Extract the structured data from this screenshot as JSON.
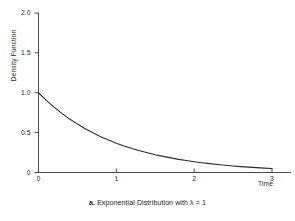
{
  "figure": {
    "caption_marker": "a.",
    "caption_text": "Exponential Distribution with λ = 1",
    "page_header_fragment": ""
  },
  "chart_data": {
    "type": "line",
    "title": "",
    "subtitle": "",
    "xlabel": "Time",
    "ylabel": "Density Function",
    "xlim": [
      0,
      3.15
    ],
    "ylim": [
      0,
      2.1
    ],
    "xticks": [
      0,
      1,
      2,
      3
    ],
    "xticklabels": [
      "0",
      "1",
      "2",
      "3"
    ],
    "yticks": [
      0,
      0.5,
      1.0,
      1.5,
      2.0
    ],
    "yticklabels": [
      "0",
      "0.5",
      "1.0",
      "1.5",
      "2.0"
    ],
    "grid": false,
    "legend": false,
    "legend_position": "none",
    "annotations": [],
    "series": [
      {
        "name": "Exponential pdf, lambda = 1",
        "formula": "f(t) = exp(-t)",
        "color": "#2b2b2b",
        "linewidth": 1.1,
        "x": [
          0,
          0.1,
          0.2,
          0.3,
          0.4,
          0.5,
          0.6,
          0.7,
          0.8,
          0.9,
          1.0,
          1.1,
          1.2,
          1.3,
          1.4,
          1.5,
          1.6,
          1.7,
          1.8,
          1.9,
          2.0,
          2.1,
          2.2,
          2.3,
          2.4,
          2.5,
          2.6,
          2.7,
          2.8,
          2.9,
          3.0
        ],
        "y": [
          1.0,
          0.905,
          0.819,
          0.741,
          0.67,
          0.607,
          0.549,
          0.497,
          0.449,
          0.407,
          0.368,
          0.333,
          0.301,
          0.273,
          0.247,
          0.223,
          0.202,
          0.183,
          0.165,
          0.15,
          0.135,
          0.122,
          0.111,
          0.1,
          0.091,
          0.082,
          0.074,
          0.067,
          0.061,
          0.055,
          0.05
        ]
      }
    ],
    "lambda": 1
  },
  "style": {
    "background": "#ffffff",
    "axis_color": "#4a4a4a",
    "curve_color": "#2b2b2b",
    "text_color": "#1a1a1a"
  }
}
